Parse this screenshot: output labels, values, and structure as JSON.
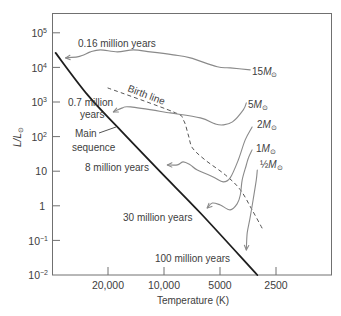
{
  "figure": {
    "y_axis_label": {
      "text": "L/L",
      "sub": "⊙"
    },
    "x_axis_label": "Temperature (K)",
    "y_ticks": [
      {
        "base": "10",
        "exp": "5"
      },
      {
        "base": "10",
        "exp": "4"
      },
      {
        "base": "10",
        "exp": "3"
      },
      {
        "base": "10",
        "exp": "2"
      },
      {
        "base": "10",
        "exp": ""
      },
      {
        "base": "1",
        "exp": ""
      },
      {
        "base": "10",
        "exp": "−1"
      },
      {
        "base": "10",
        "exp": "−2"
      }
    ],
    "x_ticks": [
      "20,000",
      "10,000",
      "5000",
      "2500"
    ],
    "annotations": {
      "time_016": "0.16 million years",
      "time_07_line1": "0.7 million",
      "time_07_line2": "years",
      "main_seq_line1": "Main",
      "main_seq_line2": "sequence",
      "birth_line": "Birth line",
      "time_8": "8 million years",
      "time_30": "30 million years",
      "time_100": "100 million years"
    },
    "mass_labels": [
      {
        "coef": "15",
        "symbol": "M",
        "sub": "⊙"
      },
      {
        "coef": "5",
        "symbol": "M",
        "sub": "⊙"
      },
      {
        "coef": "2",
        "symbol": "M",
        "sub": "⊙"
      },
      {
        "coef": "1",
        "symbol": "M",
        "sub": "⊙"
      },
      {
        "coef": "½",
        "symbol": "M",
        "sub": "⊙"
      }
    ]
  },
  "chart_data": {
    "type": "line",
    "title": "",
    "xlabel": "Temperature (K)",
    "ylabel": "L/L⊙",
    "x_scale": "log (reversed, hot to cool)",
    "y_scale": "log",
    "xlim": [
      40000,
      1260
    ],
    "ylim": [
      0.01,
      370000
    ],
    "x_ticks": [
      20000,
      10000,
      5000,
      2500
    ],
    "y_ticks": [
      100000,
      10000,
      1000,
      100,
      10,
      1,
      0.1,
      0.01
    ],
    "grid": false,
    "legend": null,
    "series": [
      {
        "name": "Main sequence",
        "style": "main",
        "arrow": false,
        "points": [
          [
            38500,
            26000
          ],
          [
            25900,
            1590
          ],
          [
            17700,
            177
          ],
          [
            10500,
            9.5
          ],
          [
            6400,
            0.62
          ],
          [
            3160,
            0.01
          ]
        ]
      },
      {
        "name": "Birth line",
        "style": "birth",
        "arrow": false,
        "points": [
          [
            20200,
            2540
          ],
          [
            8950,
            514
          ],
          [
            7910,
            302
          ],
          [
            7430,
            111
          ],
          [
            7060,
            47
          ],
          [
            6030,
            21
          ],
          [
            4700,
            7.8
          ],
          [
            3900,
            2.9
          ],
          [
            3370,
            0.76
          ],
          [
            2940,
            0.2
          ]
        ]
      },
      {
        "name": "15 M⊙",
        "style": "track",
        "arrow": true,
        "time_to_main_sequence": "0.16 million years",
        "points": [
          [
            3450,
            8400
          ],
          [
            4420,
            9600
          ],
          [
            5190,
            10300
          ],
          [
            7250,
            18700
          ],
          [
            8950,
            22800
          ],
          [
            11900,
            27900
          ],
          [
            14700,
            31800
          ],
          [
            17900,
            27900
          ],
          [
            22100,
            31800
          ],
          [
            25000,
            27900
          ],
          [
            27200,
            22800
          ],
          [
            29400,
            20000
          ],
          [
            34000,
            18700
          ]
        ]
      },
      {
        "name": "5 M⊙",
        "style": "track",
        "arrow": true,
        "time_to_main_sequence": "0.7 million years",
        "points": [
          [
            3620,
            935
          ],
          [
            3760,
            590
          ],
          [
            4300,
            264
          ],
          [
            4820,
            216
          ],
          [
            5320,
            231
          ],
          [
            6400,
            345
          ],
          [
            9290,
            481
          ],
          [
            15200,
            716
          ],
          [
            16800,
            672
          ],
          [
            18800,
            514
          ]
        ]
      },
      {
        "name": "2 M⊙",
        "style": "track",
        "arrow": true,
        "time_to_main_sequence": "8 million years",
        "points": [
          [
            3370,
            189
          ],
          [
            3670,
            80
          ],
          [
            4000,
            21
          ],
          [
            4420,
            6.4
          ],
          [
            4820,
            4.9
          ],
          [
            5460,
            6.8
          ],
          [
            6650,
            10.8
          ],
          [
            7250,
            15.1
          ],
          [
            7910,
            18.5
          ],
          [
            8510,
            15.1
          ],
          [
            9630,
            15.1
          ]
        ]
      },
      {
        "name": "1 M⊙",
        "style": "track",
        "arrow": true,
        "time_to_main_sequence": "30 million years",
        "points": [
          [
            3370,
            41
          ],
          [
            3530,
            24
          ],
          [
            3620,
            15
          ],
          [
            3810,
            5.6
          ],
          [
            3900,
            2.05
          ],
          [
            4060,
            1.13
          ],
          [
            4420,
            0.76
          ],
          [
            5000,
            1.05
          ],
          [
            5520,
            1.2
          ],
          [
            5880,
            0.86
          ]
        ]
      },
      {
        "name": "1/2 M⊙",
        "style": "track",
        "arrow": true,
        "time_to_main_sequence": "100 million years",
        "points": [
          [
            3160,
            10.8
          ],
          [
            3200,
            5.6
          ],
          [
            3330,
            1.47
          ],
          [
            3450,
            0.47
          ],
          [
            3580,
            0.164
          ],
          [
            3620,
            0.053
          ]
        ]
      }
    ]
  }
}
